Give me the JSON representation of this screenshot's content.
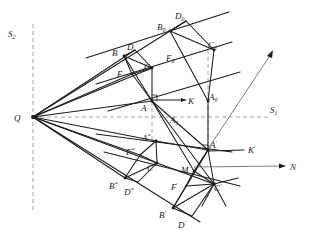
{
  "figure": {
    "background_color": "#ffffff",
    "line_color": "#1c1c1c",
    "dash_color": "#9a9a9a",
    "axis_color": "#6f6f6f",
    "width": 310,
    "height": 242
  },
  "axes": {
    "s1": {
      "label": "S",
      "sub": "1",
      "x": 272,
      "y": 111
    },
    "s2": {
      "label": "S",
      "sub": "2",
      "x": 13,
      "y": 34
    },
    "n": {
      "label": "N",
      "x": 292,
      "y": 167
    },
    "horizontal_dash_y": 117,
    "vertical_dash_x_left": 33,
    "vertical_dash_x_mid": 152,
    "vertical_dash_x_right": 208
  },
  "points": {
    "Q": {
      "label": "Q",
      "sub": "",
      "x": 33,
      "y": 117,
      "lx": 17,
      "ly": 118
    },
    "B": {
      "label": "B",
      "sub": "",
      "x": 124,
      "y": 56,
      "lx": 114,
      "ly": 53
    },
    "D": {
      "label": "D",
      "sub": "",
      "x": 135,
      "y": 50,
      "lx": 130,
      "ly": 48
    },
    "C": {
      "label": "C",
      "sub": "",
      "x": 152,
      "y": 68,
      "lx": 146,
      "ly": 67
    },
    "F": {
      "label": "F",
      "sub": "",
      "x": 132,
      "y": 74,
      "lx": 120,
      "ly": 74
    },
    "A": {
      "label": "A",
      "sub": "",
      "x": 152,
      "y": 101,
      "lx": 143,
      "ly": 108
    },
    "A1": {
      "label": "A",
      "sub": "1",
      "x": 174,
      "y": 117,
      "lx": 174,
      "ly": 118
    },
    "K": {
      "label": "K",
      "sub": "",
      "x": 185,
      "y": 100,
      "lx": 190,
      "ly": 102
    },
    "A0": {
      "label": "A",
      "sub": "0",
      "x": 208,
      "y": 101,
      "lx": 211,
      "ly": 99
    },
    "B0": {
      "label": "B",
      "sub": "0",
      "x": 170,
      "y": 31,
      "lx": 161,
      "ly": 27
    },
    "D0": {
      "label": "D",
      "sub": "0",
      "x": 186,
      "y": 21,
      "lx": 179,
      "ly": 16
    },
    "C0": {
      "label": "C",
      "sub": "0",
      "x": 214,
      "y": 50,
      "lx": 211,
      "ly": 45
    },
    "F0": {
      "label": "F",
      "sub": "0",
      "x": 178,
      "y": 58,
      "lx": 170,
      "ly": 58
    },
    "Astar": {
      "label": "A",
      "sub": "*",
      "x": 156,
      "y": 141,
      "lx": 146,
      "ly": 139
    },
    "Fstar": {
      "label": "F",
      "sub": "*",
      "x": 140,
      "y": 155,
      "lx": 130,
      "ly": 153
    },
    "Cstar": {
      "label": "C",
      "sub": "*",
      "x": 157,
      "y": 163,
      "lx": 150,
      "ly": 166
    },
    "Bstar": {
      "label": "B",
      "sub": "*",
      "x": 125,
      "y": 178,
      "lx": 114,
      "ly": 184
    },
    "Dstar": {
      "label": "D",
      "sub": "*",
      "x": 138,
      "y": 182,
      "lx": 128,
      "ly": 190
    },
    "Aprime": {
      "label": "A",
      "sub": "'",
      "x": 208,
      "y": 150,
      "lx": 211,
      "ly": 147
    },
    "Kprime": {
      "label": "K",
      "sub": "'",
      "x": 246,
      "y": 150,
      "lx": 250,
      "ly": 152
    },
    "M": {
      "label": "M",
      "sub": "",
      "x": 194,
      "y": 171,
      "lx": 185,
      "ly": 170
    },
    "Fprime": {
      "label": "F",
      "sub": "'",
      "x": 186,
      "y": 186,
      "lx": 175,
      "ly": 186
    },
    "Cprime": {
      "label": "C",
      "sub": "'",
      "x": 214,
      "y": 184,
      "lx": 216,
      "ly": 188
    },
    "Bprime": {
      "label": "B",
      "sub": "'",
      "x": 173,
      "y": 208,
      "lx": 163,
      "ly": 214
    },
    "Dprime": {
      "label": "D",
      "sub": "'",
      "x": 192,
      "y": 216,
      "lx": 182,
      "ly": 224
    }
  },
  "labels": [
    {
      "name": "label-S2",
      "text": "S",
      "sub": "2",
      "x": 13,
      "y": 34
    },
    {
      "name": "label-S1",
      "text": "S",
      "sub": "1",
      "x": 272,
      "y": 111
    },
    {
      "name": "label-N",
      "text": "N",
      "sub": "",
      "x": 292,
      "y": 167
    },
    {
      "name": "label-Q",
      "text": "Q",
      "sub": "",
      "x": 17,
      "y": 118
    },
    {
      "name": "label-B",
      "text": "B",
      "sub": "",
      "x": 114,
      "y": 53
    },
    {
      "name": "label-D",
      "text": "D",
      "sub": "",
      "x": 130,
      "y": 48
    },
    {
      "name": "label-C",
      "text": "C",
      "sub": "",
      "x": 146,
      "y": 67
    },
    {
      "name": "label-F",
      "text": "F",
      "sub": "",
      "x": 120,
      "y": 74
    },
    {
      "name": "label-A",
      "text": "A",
      "sub": "",
      "x": 143,
      "y": 108
    },
    {
      "name": "label-A1",
      "text": "A",
      "sub": "1",
      "x": 173,
      "y": 120
    },
    {
      "name": "label-K",
      "text": "K",
      "sub": "",
      "x": 190,
      "y": 103
    },
    {
      "name": "label-A0",
      "text": "A",
      "sub": "0",
      "x": 211,
      "y": 99
    },
    {
      "name": "label-B0",
      "text": "B",
      "sub": "0",
      "x": 160,
      "y": 28
    },
    {
      "name": "label-D0",
      "text": "D",
      "sub": "0",
      "x": 178,
      "y": 17
    },
    {
      "name": "label-C0",
      "text": "C",
      "sub": "0",
      "x": 210,
      "y": 46
    },
    {
      "name": "label-F0",
      "text": "F",
      "sub": "0",
      "x": 169,
      "y": 59
    },
    {
      "name": "label-A-star",
      "text": "A",
      "sub": "*",
      "x": 145,
      "y": 139
    },
    {
      "name": "label-F-star",
      "text": "F",
      "sub": "*",
      "x": 129,
      "y": 153
    },
    {
      "name": "label-C-star",
      "text": "C",
      "sub": "*",
      "x": 150,
      "y": 168
    },
    {
      "name": "label-B-star",
      "text": "B",
      "sub": "*",
      "x": 112,
      "y": 186
    },
    {
      "name": "label-D-star",
      "text": "D",
      "sub": "*",
      "x": 127,
      "y": 192
    },
    {
      "name": "label-A-prime",
      "text": "A",
      "sub": "'",
      "x": 211,
      "y": 147
    },
    {
      "name": "label-K-prime",
      "text": "K",
      "sub": "'",
      "x": 250,
      "y": 152
    },
    {
      "name": "label-M",
      "text": "M",
      "sub": "",
      "x": 184,
      "y": 171
    },
    {
      "name": "label-F-prime",
      "text": "F",
      "sub": "'",
      "x": 174,
      "y": 188
    },
    {
      "name": "label-C-prime",
      "text": "C",
      "sub": "'",
      "x": 216,
      "y": 189
    },
    {
      "name": "label-B-prime",
      "text": "B",
      "sub": "'",
      "x": 162,
      "y": 215
    },
    {
      "name": "label-D-prime",
      "text": "D",
      "sub": "'",
      "x": 181,
      "y": 226
    }
  ]
}
